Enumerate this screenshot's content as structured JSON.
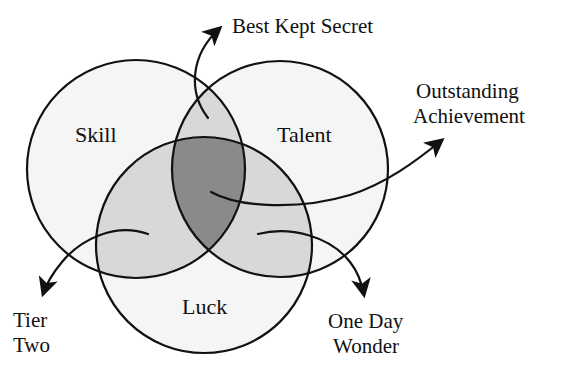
{
  "diagram": {
    "type": "venn",
    "sets": [
      {
        "id": "skill",
        "label": "Skill"
      },
      {
        "id": "talent",
        "label": "Talent"
      },
      {
        "id": "luck",
        "label": "Luck"
      }
    ],
    "outcomes": {
      "best_kept_secret": {
        "label": "Best Kept Secret",
        "region": "Skill ∩ Talent"
      },
      "outstanding": {
        "line1": "Outstanding",
        "line2": "Achievement",
        "region": "Skill ∩ Talent ∩ Luck"
      },
      "tier_two": {
        "line1": "Tier",
        "line2": "Two",
        "region": "Skill ∩ Luck"
      },
      "one_day_wonder": {
        "line1": "One Day",
        "line2": "Wonder",
        "region": "Talent ∩ Luck"
      }
    },
    "colors": {
      "background": "#ffffff",
      "single_region": "#f5f5f5",
      "pair_overlap": "#d8d8d8",
      "triple_overlap": "#8a8a8a",
      "stroke": "#111111"
    }
  }
}
